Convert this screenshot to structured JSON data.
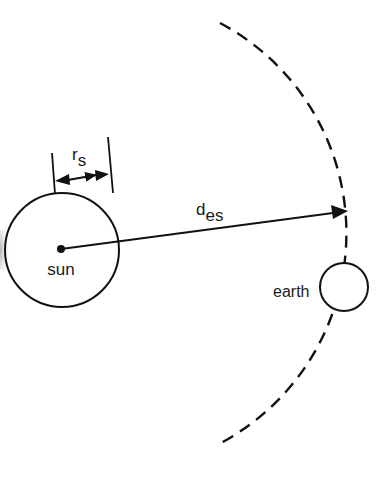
{
  "diagram": {
    "colors": {
      "stroke": "#111111",
      "background": "#ffffff",
      "text": "#1a1a1a"
    },
    "sun": {
      "label": "sun",
      "cx": 62,
      "cy": 250,
      "r": 57
    },
    "earth": {
      "label": "earth",
      "cx": 344,
      "cy": 287,
      "r": 24
    },
    "radius_marker": {
      "label_main": "r",
      "label_sub": "s"
    },
    "distance_arrow": {
      "label_main": "d",
      "label_sub": "es"
    },
    "orbit": {
      "style": "dashed",
      "cx": 112,
      "cy": 236,
      "r": 238
    }
  }
}
